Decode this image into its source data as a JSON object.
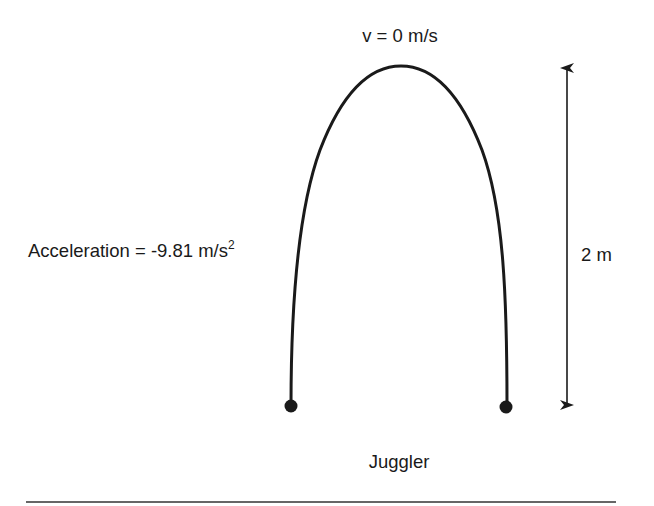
{
  "diagram": {
    "title_label": "v = 0 m/s",
    "acceleration_label": "Acceleration = -9.81 m/s",
    "acceleration_exponent": "2",
    "height_label": "2 m",
    "base_label": "Juggler",
    "colors": {
      "stroke": "#1a1a1a",
      "background": "#ffffff"
    }
  }
}
